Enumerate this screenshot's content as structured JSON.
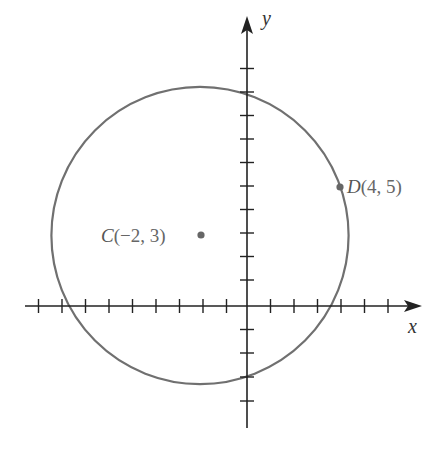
{
  "diagram": {
    "type": "coordinate-plane-circle",
    "axes": {
      "x_label": "x",
      "y_label": "y",
      "x_ticks": [
        -9,
        -8,
        -7,
        -6,
        -5,
        -4,
        -3,
        -2,
        -1,
        1,
        2,
        3,
        4,
        5,
        6,
        7
      ],
      "y_ticks": [
        -4,
        -3,
        -2,
        -1,
        1,
        2,
        3,
        4,
        5,
        6,
        7,
        8,
        9,
        10
      ]
    },
    "points": [
      {
        "name": "C",
        "coords": "(−2, 3)",
        "x": -2,
        "y": 3,
        "role": "center"
      },
      {
        "name": "D",
        "coords": "(4, 5)",
        "x": 4,
        "y": 5,
        "role": "point-on-circle"
      }
    ],
    "circle": {
      "center": [
        -2,
        3
      ],
      "through": [
        4,
        5
      ],
      "radius_squared": 40
    },
    "colors": {
      "axis": "#222222",
      "circle": "#707070",
      "point": "#666666",
      "label": "#666666"
    }
  }
}
